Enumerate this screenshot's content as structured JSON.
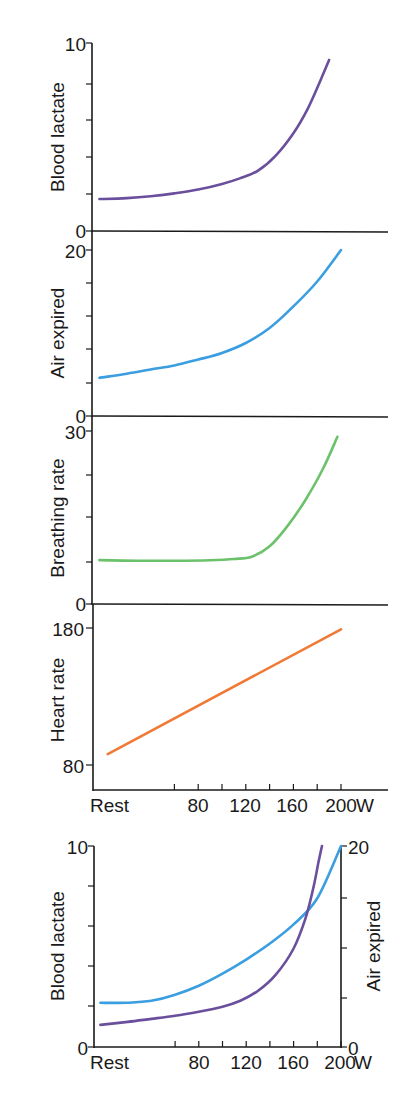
{
  "chart_data": [
    {
      "type": "line",
      "title": "",
      "ylabel": "Blood lactate",
      "xlabel": "",
      "ylim": [
        0,
        10
      ],
      "ytick_labels": [
        "0",
        "10"
      ],
      "yticks": [
        0,
        2,
        4,
        6,
        8,
        10
      ],
      "series": [
        {
          "name": "Blood lactate",
          "color": "#6a4f9c",
          "x": [
            -3,
            20,
            40,
            60,
            80,
            100,
            115,
            130,
            145,
            160,
            172,
            182,
            190
          ],
          "y": [
            1.7,
            1.75,
            1.85,
            2.0,
            2.2,
            2.5,
            2.8,
            3.2,
            4.0,
            5.2,
            6.5,
            7.9,
            9.1
          ]
        }
      ]
    },
    {
      "type": "line",
      "ylabel": "Air expired",
      "ylim": [
        0,
        20
      ],
      "ytick_labels": [
        "0",
        "20"
      ],
      "yticks": [
        0,
        4,
        8,
        12,
        16,
        20
      ],
      "series": [
        {
          "name": "Air expired",
          "color": "#3a9ee0",
          "x": [
            -3,
            20,
            40,
            60,
            80,
            100,
            120,
            140,
            160,
            180,
            200
          ],
          "y": [
            4.6,
            5.1,
            5.6,
            6.1,
            6.8,
            7.6,
            8.8,
            10.6,
            13.2,
            16.2,
            20
          ]
        }
      ]
    },
    {
      "type": "line",
      "ylabel": "Breathing rate",
      "ylim": [
        0,
        30
      ],
      "ytick_labels": [
        "0",
        "30"
      ],
      "yticks": [
        0,
        7.5,
        15,
        22.5,
        30
      ],
      "series": [
        {
          "name": "Breathing rate",
          "color": "#6cc26a",
          "x": [
            -3,
            30,
            60,
            90,
            110,
            125,
            140,
            155,
            170,
            185,
            197
          ],
          "y": [
            7.6,
            7.5,
            7.5,
            7.6,
            7.8,
            8.2,
            10,
            13.5,
            18,
            23.5,
            29
          ]
        }
      ]
    },
    {
      "type": "line",
      "ylabel": "Heart rate",
      "ylim": [
        75,
        185
      ],
      "ytick_labels": [
        "80",
        "180"
      ],
      "yticks": [
        80,
        180
      ],
      "xlabel": "W",
      "xtick_labels": [
        "Rest",
        "80",
        "120",
        "160",
        "200 W"
      ],
      "xticks": [
        60,
        80,
        100,
        120,
        140,
        160,
        180,
        200
      ],
      "series": [
        {
          "name": "Heart rate",
          "color": "#f07a35",
          "x": [
            4,
            200
          ],
          "y": [
            88,
            179
          ]
        }
      ]
    },
    {
      "type": "line",
      "title": "",
      "ylabel": "Blood lactate",
      "ylabel_right": "Air expired",
      "ylim": [
        0,
        10
      ],
      "ylim_right": [
        0,
        20
      ],
      "ytick_labels": [
        "0",
        "10"
      ],
      "ytick_labels_right": [
        "0",
        "20"
      ],
      "yticks": [
        0,
        2,
        4,
        6,
        8,
        10
      ],
      "yticks_right": [
        0,
        5,
        10,
        15,
        20
      ],
      "xtick_labels": [
        "Rest",
        "80",
        "120",
        "160",
        "200 W"
      ],
      "xticks": [
        60,
        80,
        100,
        120,
        140,
        160,
        180,
        200
      ],
      "series": [
        {
          "name": "Air expired",
          "axis": "right",
          "color": "#3a9ee0",
          "x": [
            -3,
            20,
            40,
            60,
            80,
            100,
            120,
            140,
            160,
            180,
            200
          ],
          "y": [
            4.4,
            4.4,
            4.6,
            5.2,
            6.1,
            7.3,
            8.7,
            10.3,
            12.2,
            14.8,
            20
          ]
        },
        {
          "name": "Blood lactate",
          "axis": "left",
          "color": "#6a4f9c",
          "x": [
            -3,
            20,
            40,
            60,
            80,
            100,
            115,
            130,
            145,
            160,
            170,
            177,
            181,
            184
          ],
          "y": [
            1.1,
            1.25,
            1.4,
            1.55,
            1.75,
            2.0,
            2.3,
            2.8,
            3.6,
            4.9,
            6.4,
            8.0,
            9.2,
            10
          ]
        }
      ]
    }
  ],
  "labels": {
    "p1_ylabel": "Blood lactate",
    "p1_ytop": "10",
    "p1_ybottom": "0",
    "p2_ylabel": "Air expired",
    "p2_ytop": "20",
    "p2_ybottom": "0",
    "p3_ylabel": "Breathing rate",
    "p3_ytop": "30",
    "p3_ybottom": "0",
    "p4_ylabel": "Heart rate",
    "p4_ytop": "180",
    "p4_ybottom": "80",
    "x_rest": "Rest",
    "x_80": "80",
    "x_120": "120",
    "x_160": "160",
    "x_200": "200",
    "x_unit": "W",
    "p5_ylabel_left": "Blood lactate",
    "p5_ylabel_right": "Air expired",
    "p5_ytop_left": "10",
    "p5_ybottom_left": "0",
    "p5_ytop_right": "20",
    "p5_ybottom_right": "0"
  }
}
